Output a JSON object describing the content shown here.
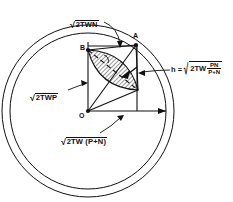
{
  "figure": {
    "type": "geometric-vector-diagram",
    "background": "#ffffff",
    "line_color": "#111111",
    "hatch_color": "#222222"
  },
  "labels": {
    "top": {
      "name": "sqrt-2TWN",
      "radical_body": "2TWN",
      "radical_sign": "√"
    },
    "left": {
      "name": "sqrt-2TWP",
      "radical_body": "2TWP",
      "radical_sign": "√"
    },
    "bottom": {
      "name": "sqrt-2TW-P-plus-N",
      "radical_body": "2TW (P+N)",
      "radical_sign": "√"
    },
    "right_equation": {
      "name": "h-equation",
      "lhs": "h =",
      "radical_sign": "√",
      "radical_body": "2TW",
      "fraction_numerator": "PN",
      "fraction_denominator": "P+N"
    }
  },
  "points": [
    {
      "id": "A",
      "label": "A",
      "x": 136,
      "y": 45
    },
    {
      "id": "B",
      "label": "B",
      "x": 88,
      "y": 50
    },
    {
      "id": "O",
      "label": "O",
      "x": 88,
      "y": 111
    }
  ],
  "geometry": {
    "center": {
      "x": 88,
      "y": 111
    },
    "outer_circle_radius": 86,
    "inner_circle_radius": 78,
    "vertex_right": {
      "x": 138,
      "y": 90
    },
    "horizontal_arrow_end": {
      "x": 166,
      "y": 111
    }
  },
  "colors": {
    "stroke": "#111111",
    "background": "#ffffff",
    "hatch": "#333333"
  }
}
